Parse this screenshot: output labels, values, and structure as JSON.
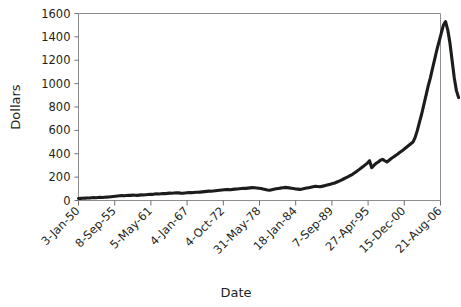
{
  "chart_data": {
    "type": "line",
    "title": "",
    "xlabel": "Date",
    "ylabel": "Dollars",
    "grid": false,
    "legend": null,
    "ylim": [
      0,
      1600
    ],
    "ytick_labels": [
      "0",
      "200",
      "400",
      "600",
      "800",
      "1000",
      "1200",
      "1400",
      "1600"
    ],
    "yticks": [
      0,
      200,
      400,
      600,
      800,
      1000,
      1200,
      1400,
      1600
    ],
    "xtick_labels": [
      "3-Jan-50",
      "8-Sep-55",
      "5-May-61",
      "4-Jan-67",
      "4-Oct-72",
      "31-May-78",
      "18-Jan-84",
      "7-Sep-89",
      "27-Apr-95",
      "15-Dec-00",
      "21-Aug-06"
    ],
    "xtick_positions": [
      0,
      1,
      2,
      3,
      4,
      5,
      6,
      7,
      8,
      9,
      10
    ],
    "xtick_rotation_deg": 45,
    "series": [
      {
        "name": "Dollars",
        "color": "#1c1c1c",
        "x": [
          0.0,
          0.06,
          0.12,
          0.18,
          0.24,
          0.3,
          0.36,
          0.42,
          0.48,
          0.54,
          0.6,
          0.66,
          0.72,
          0.78,
          0.84,
          0.9,
          0.96,
          1.02,
          1.08,
          1.14,
          1.2,
          1.26,
          1.32,
          1.38,
          1.44,
          1.5,
          1.56,
          1.62,
          1.68,
          1.74,
          1.8,
          1.86,
          1.92,
          1.98,
          2.04,
          2.1,
          2.16,
          2.22,
          2.28,
          2.34,
          2.4,
          2.46,
          2.52,
          2.58,
          2.64,
          2.7,
          2.76,
          2.82,
          2.88,
          2.94,
          3.0,
          3.06,
          3.12,
          3.18,
          3.24,
          3.3,
          3.36,
          3.42,
          3.48,
          3.54,
          3.6,
          3.66,
          3.72,
          3.78,
          3.84,
          3.9,
          3.96,
          4.02,
          4.08,
          4.14,
          4.2,
          4.26,
          4.32,
          4.38,
          4.44,
          4.5,
          4.56,
          4.62,
          4.68,
          4.74,
          4.8,
          4.86,
          4.92,
          4.98,
          5.04,
          5.1,
          5.16,
          5.22,
          5.28,
          5.34,
          5.4,
          5.46,
          5.52,
          5.58,
          5.64,
          5.7,
          5.76,
          5.82,
          5.88,
          5.94,
          6.0,
          6.06,
          6.12,
          6.18,
          6.24,
          6.3,
          6.36,
          6.42,
          6.48,
          6.54,
          6.6,
          6.66,
          6.72,
          6.78,
          6.84,
          6.9,
          6.96,
          7.02,
          7.08,
          7.14,
          7.2,
          7.26,
          7.32,
          7.38,
          7.44,
          7.5,
          7.56,
          7.62,
          7.68,
          7.74,
          7.8,
          7.86,
          7.92,
          7.98,
          8.04,
          8.1,
          8.16,
          8.22,
          8.28,
          8.34,
          8.4,
          8.46,
          8.52,
          8.58,
          8.64,
          8.7,
          8.76,
          8.82,
          8.88,
          8.94,
          9.0,
          9.06,
          9.12,
          9.18,
          9.24,
          9.3,
          9.36,
          9.42,
          9.48,
          9.54,
          9.6,
          9.66,
          9.72,
          9.78,
          9.84,
          9.9,
          9.96,
          10.02,
          10.08,
          10.14,
          10.2,
          10.26,
          10.32,
          10.38,
          10.44,
          10.5
        ],
        "y": [
          17,
          18,
          19,
          20,
          21,
          22,
          24,
          25,
          24,
          26,
          27,
          26,
          28,
          29,
          30,
          32,
          34,
          36,
          38,
          40,
          42,
          41,
          43,
          45,
          44,
          46,
          45,
          44,
          46,
          48,
          47,
          49,
          51,
          53,
          52,
          55,
          57,
          56,
          58,
          60,
          59,
          61,
          63,
          62,
          64,
          66,
          65,
          63,
          62,
          64,
          66,
          68,
          67,
          69,
          71,
          70,
          72,
          74,
          76,
          78,
          80,
          79,
          82,
          84,
          86,
          88,
          90,
          92,
          94,
          93,
          92,
          95,
          97,
          99,
          101,
          103,
          105,
          104,
          106,
          108,
          110,
          109,
          107,
          105,
          103,
          98,
          94,
          90,
          88,
          92,
          96,
          100,
          103,
          106,
          109,
          112,
          110,
          108,
          105,
          102,
          99,
          97,
          95,
          98,
          102,
          106,
          110,
          114,
          118,
          122,
          120,
          118,
          121,
          125,
          130,
          135,
          140,
          145,
          150,
          158,
          166,
          175,
          184,
          193,
          202,
          212,
          222,
          235,
          248,
          262,
          276,
          290,
          305,
          320,
          340,
          280,
          300,
          318,
          330,
          345,
          352,
          340,
          330,
          345,
          360,
          372,
          385,
          398,
          412,
          425,
          440,
          455,
          470,
          485,
          500,
          540,
          600,
          670,
          740,
          820,
          900,
          980,
          1050,
          1130,
          1210,
          1290,
          1360,
          1430,
          1500,
          1530,
          1460,
          1350,
          1200,
          1050,
          940,
          880
        ]
      }
    ],
    "annotations": []
  },
  "axis_titles": {
    "x": "Date",
    "y": "Dollars"
  }
}
